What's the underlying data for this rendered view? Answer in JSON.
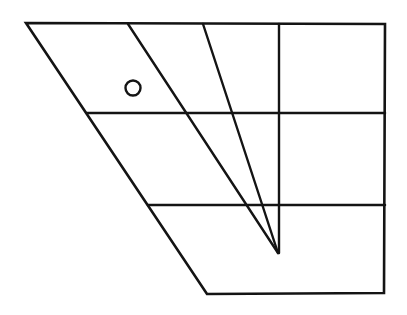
{
  "figure": {
    "background_color": "#ffffff",
    "stroke_color": "#141414",
    "canvas": {
      "width": 407,
      "height": 315
    },
    "outline": {
      "name": "panel-outline",
      "type": "polygon",
      "points": "26,23 385,24 384,293 207,294",
      "vertices": [
        {
          "label": "top-left",
          "x": 26,
          "y": 23
        },
        {
          "label": "top-right",
          "x": 385,
          "y": 24
        },
        {
          "label": "bottom-right",
          "x": 384,
          "y": 293
        },
        {
          "label": "bottom-left",
          "x": 207,
          "y": 294
        }
      ],
      "stroke_width": 2.6
    },
    "horizontal_lines": [
      {
        "name": "upper-horizontal-divider",
        "x1": 87,
        "y1": 113,
        "x2": 385,
        "y2": 113,
        "stroke_width": 2.5
      },
      {
        "name": "lower-horizontal-divider",
        "x1": 148,
        "y1": 205,
        "x2": 385,
        "y2": 205,
        "stroke_width": 2.5
      }
    ],
    "converging_lines": [
      {
        "name": "left-converging-line",
        "x1": 128,
        "y1": 24,
        "x2": 278,
        "y2": 253,
        "stroke_width": 2.4
      },
      {
        "name": "right-converging-line",
        "x1": 203,
        "y1": 24,
        "x2": 278,
        "y2": 253,
        "stroke_width": 2.4
      },
      {
        "name": "vertical-converging-line",
        "x1": 279,
        "y1": 24,
        "x2": 279,
        "y2": 253,
        "stroke_width": 2.4
      }
    ],
    "apex": {
      "name": "convergence-point",
      "x": 278,
      "y": 253
    },
    "marker": {
      "name": "circle-marker",
      "cx": 133,
      "cy": 88,
      "r": 7.5,
      "stroke_width": 2.4,
      "fill": "none"
    }
  }
}
